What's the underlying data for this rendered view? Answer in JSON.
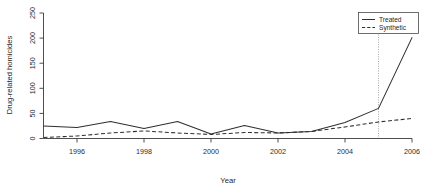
{
  "chart_data": {
    "type": "line",
    "title": "",
    "xlabel": "Year",
    "ylabel": "Drug-related homicides",
    "xlim": [
      1995,
      2006
    ],
    "ylim": [
      0,
      250
    ],
    "grid": false,
    "legend_position": "top-right",
    "x": [
      1995,
      1996,
      1997,
      1998,
      1999,
      2000,
      2001,
      2002,
      2003,
      2004,
      2005,
      2006
    ],
    "xticks": [
      1996,
      1998,
      2000,
      2002,
      2004,
      2006
    ],
    "xtick_labels": [
      "1996",
      "1998",
      "2000",
      "2002",
      "2004",
      "2006"
    ],
    "yticks": [
      0,
      50,
      100,
      150,
      200,
      250
    ],
    "ytick_labels": [
      "0",
      "50",
      "100",
      "150",
      "200",
      "250"
    ],
    "series": [
      {
        "name": "Treated",
        "style": "solid",
        "color": "#2f2f2f",
        "values": [
          25,
          22,
          34,
          20,
          34,
          9,
          26,
          11,
          14,
          32,
          60,
          201
        ]
      },
      {
        "name": "Synthetic",
        "style": "dashed",
        "color": "#2f2f2f",
        "values": [
          2,
          5,
          11,
          15,
          11,
          8,
          12,
          11,
          14,
          23,
          33,
          40
        ]
      }
    ],
    "annotations": [
      {
        "type": "vertical-line",
        "name": "intervention-year",
        "x": 2005,
        "style": "dotted",
        "color": "#8f8f8f"
      }
    ]
  },
  "legend": {
    "entries": [
      {
        "label": "Treated",
        "style": "solid"
      },
      {
        "label": "Synthetic",
        "style": "dashed"
      }
    ]
  },
  "icons": {
    "legend_solid": "solid-line-icon",
    "legend_dashed": "dashed-line-icon"
  }
}
